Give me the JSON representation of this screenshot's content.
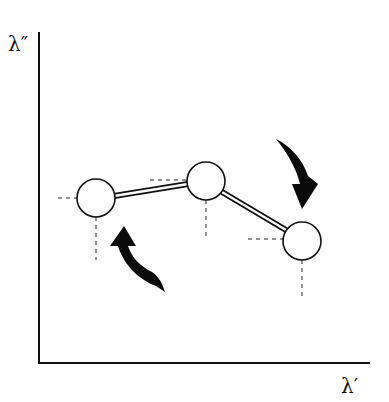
{
  "axes": {
    "y_label": "λ″",
    "x_label": "λ′",
    "origin": [
      39,
      363
    ],
    "y_top": 32,
    "x_right": 370
  },
  "nodes": [
    {
      "id": "node-1",
      "cx": 96,
      "cy": 198,
      "r": 19
    },
    {
      "id": "node-2",
      "cx": 206,
      "cy": 181,
      "r": 19
    },
    {
      "id": "node-3",
      "cx": 302,
      "cy": 241,
      "r": 19
    }
  ],
  "bonds": [
    {
      "from": "node-1",
      "to": "node-2",
      "style": "double-line"
    },
    {
      "from": "node-2",
      "to": "node-3",
      "style": "double-line"
    }
  ],
  "rotation_arrows": [
    {
      "id": "arrow-left",
      "near": "node-1",
      "direction": "counter-clockwise-up"
    },
    {
      "id": "arrow-right",
      "near": "node-3",
      "direction": "clockwise-down"
    }
  ],
  "colors": {
    "line": "#111111",
    "background": "#ffffff",
    "arrow_fill": "#0a0a0a"
  }
}
